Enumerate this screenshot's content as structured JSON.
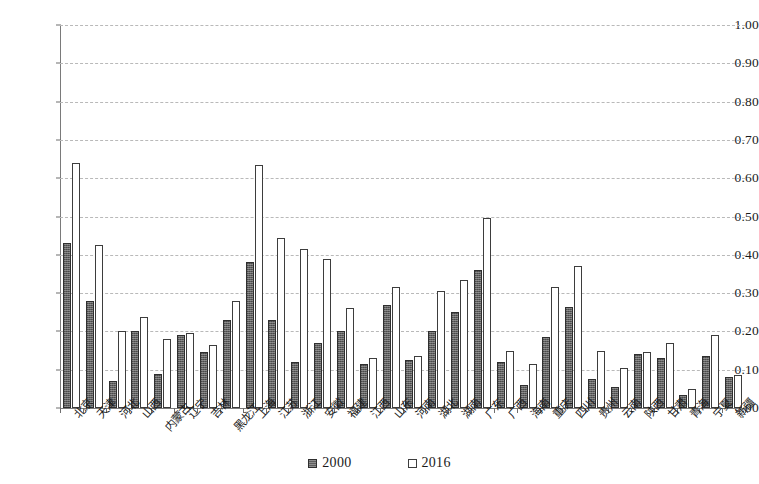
{
  "chart_data": {
    "type": "bar",
    "title": "",
    "subtitle": "",
    "xlabel": "",
    "ylabel": "",
    "ylim": [
      0,
      1.0
    ],
    "ytick_step": 0.1,
    "ytick_labels": [
      "0.00",
      "0.10",
      "0.20",
      "0.30",
      "0.40",
      "0.50",
      "0.60",
      "0.70",
      "0.80",
      "0.90",
      "1.00"
    ],
    "grid": true,
    "grid_style": "dashed horizontal",
    "legend_position": "bottom-center",
    "categories": [
      "北京",
      "天津",
      "河北",
      "山西",
      "内蒙古",
      "辽宁",
      "吉林",
      "黑龙江",
      "上海",
      "江苏",
      "浙江",
      "安徽",
      "福建",
      "江西",
      "山东",
      "河南",
      "湖北",
      "湖南",
      "广东",
      "广西",
      "海南",
      "重庆",
      "四川",
      "贵州",
      "云南",
      "陕西",
      "甘肃",
      "青海",
      "宁夏",
      "新疆"
    ],
    "series": [
      {
        "name": "2000",
        "color": "#5f5f5f",
        "style": "filled-hatched",
        "values": [
          0.43,
          0.28,
          0.07,
          0.2,
          0.09,
          0.19,
          0.145,
          0.23,
          0.38,
          0.23,
          0.12,
          0.17,
          0.2,
          0.115,
          0.27,
          0.125,
          0.2,
          0.25,
          0.36,
          0.12,
          0.06,
          0.185,
          0.265,
          0.075,
          0.055,
          0.14,
          0.13,
          0.035,
          0.135,
          0.08
        ]
      },
      {
        "name": "2016",
        "color": "#ffffff",
        "style": "outlined",
        "values": [
          0.64,
          0.425,
          0.2,
          0.238,
          0.18,
          0.195,
          0.165,
          0.28,
          0.635,
          0.445,
          0.415,
          0.39,
          0.26,
          0.13,
          0.315,
          0.135,
          0.305,
          0.335,
          0.495,
          0.15,
          0.115,
          0.315,
          0.37,
          0.15,
          0.105,
          0.145,
          0.17,
          0.05,
          0.19,
          0.085
        ]
      }
    ]
  },
  "legend": {
    "items": [
      {
        "label": "2000",
        "swatch": "filled-dark-square"
      },
      {
        "label": "2016",
        "swatch": "outlined-white-square"
      }
    ]
  }
}
